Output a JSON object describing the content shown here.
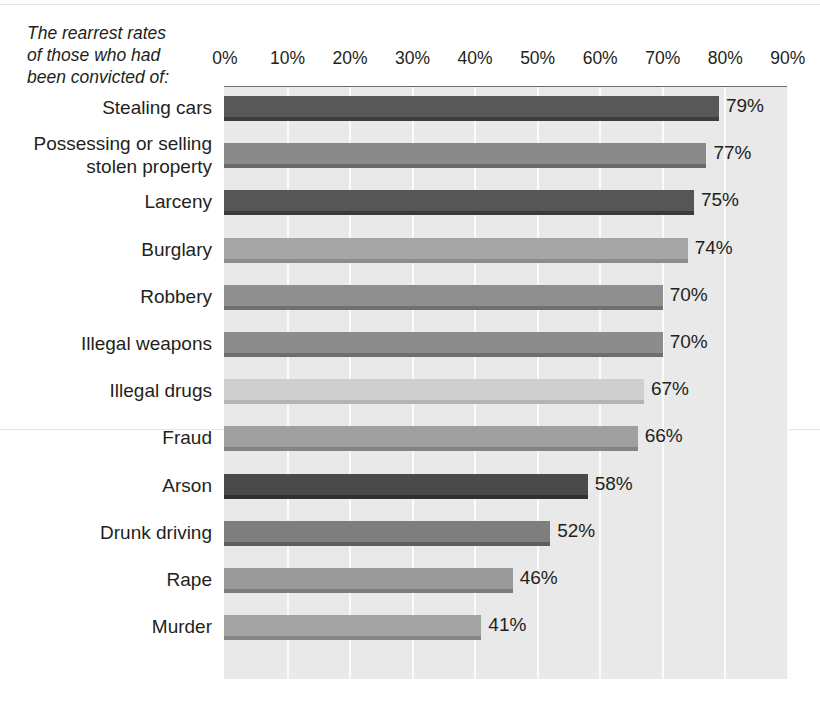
{
  "title": {
    "text": "The rearrest rates\nof those who had\nbeen convicted of:"
  },
  "chart_data": {
    "type": "bar",
    "orientation": "horizontal",
    "title": "The rearrest rates of those who had been convicted of:",
    "xlabel": "",
    "ylabel": "",
    "xlim": [
      0,
      90
    ],
    "grid": true,
    "legend": "none",
    "tick_labels": [
      "0%",
      "10%",
      "20%",
      "30%",
      "40%",
      "50%",
      "60%",
      "70%",
      "80%",
      "90%"
    ],
    "tick_values": [
      0,
      10,
      20,
      30,
      40,
      50,
      60,
      70,
      80,
      90
    ],
    "categories": [
      "Stealing cars",
      "Possessing or selling\nstolen property",
      "Larceny",
      "Burglary",
      "Robbery",
      "Illegal weapons",
      "Illegal drugs",
      "Fraud",
      "Arson",
      "Drunk driving",
      "Rape",
      "Murder"
    ],
    "values": [
      79,
      77,
      75,
      74,
      70,
      70,
      67,
      66,
      58,
      52,
      46,
      41
    ],
    "value_labels": [
      "79%",
      "77%",
      "75%",
      "74%",
      "70%",
      "70%",
      "67%",
      "66%",
      "58%",
      "52%",
      "46%",
      "41%"
    ],
    "bar_colors": [
      "#585858",
      "#8a8a8a",
      "#565656",
      "#a6a6a6",
      "#8f8f8f",
      "#8c8c8c",
      "#cfcfcf",
      "#a0a0a0",
      "#4a4a4a",
      "#7e7e7e",
      "#9a9a9a",
      "#a3a3a3"
    ],
    "bar_shadow_colors": [
      "#3d3d3d",
      "#6a6a6a",
      "#3b3b3b",
      "#8c8c8c",
      "#707070",
      "#6e6e6e",
      "#b4b4b4",
      "#848484",
      "#303030",
      "#5e5e5e",
      "#7c7c7c",
      "#868686"
    ],
    "plot_background": "#e9e9e9",
    "gridline_color": "#fbfbfb",
    "text_color": "#231f20"
  }
}
